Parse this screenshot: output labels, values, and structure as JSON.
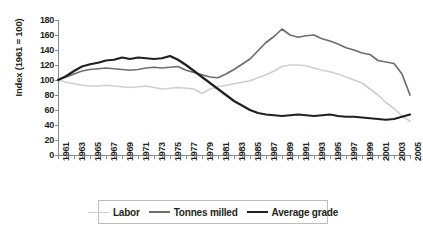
{
  "chart_data": {
    "type": "line",
    "title": "",
    "xlabel": "",
    "ylabel": "Index (1961 = 100)",
    "ylim": [
      0,
      180
    ],
    "yticks": [
      0,
      20,
      40,
      60,
      80,
      100,
      120,
      140,
      160,
      180
    ],
    "xlim": [
      1961,
      2005
    ],
    "grid": false,
    "legend_position": "bottom",
    "x": [
      1961,
      1962,
      1963,
      1964,
      1965,
      1966,
      1967,
      1968,
      1969,
      1970,
      1971,
      1972,
      1973,
      1974,
      1975,
      1976,
      1977,
      1978,
      1979,
      1980,
      1981,
      1982,
      1983,
      1984,
      1985,
      1986,
      1987,
      1988,
      1989,
      1990,
      1991,
      1992,
      1993,
      1994,
      1995,
      1996,
      1997,
      1998,
      1999,
      2000,
      2001,
      2002,
      2003,
      2004,
      2005
    ],
    "xtick_labels": [
      "1961",
      "1963",
      "1965",
      "1967",
      "1969",
      "1971",
      "1973",
      "1975",
      "1977",
      "1979",
      "1981",
      "1983",
      "1985",
      "1987",
      "1989",
      "1991",
      "1993",
      "1995",
      "1997",
      "1999",
      "2001",
      "2003",
      "2005"
    ],
    "series": [
      {
        "name": "Labor",
        "color": "#cfcfcf",
        "values": [
          100,
          97,
          95,
          93,
          92,
          92,
          93,
          92,
          91,
          90,
          91,
          92,
          90,
          88,
          89,
          90,
          89,
          88,
          82,
          88,
          91,
          93,
          95,
          97,
          99,
          103,
          107,
          112,
          118,
          120,
          120,
          119,
          116,
          113,
          111,
          108,
          104,
          100,
          96,
          88,
          80,
          70,
          62,
          52,
          45
        ]
      },
      {
        "name": "Tonnes milled",
        "color": "#6d6e70",
        "values": [
          100,
          104,
          108,
          112,
          114,
          115,
          116,
          115,
          114,
          113,
          114,
          116,
          117,
          116,
          117,
          118,
          113,
          110,
          107,
          104,
          103,
          108,
          114,
          121,
          128,
          139,
          150,
          158,
          168,
          160,
          157,
          159,
          160,
          155,
          152,
          148,
          143,
          140,
          136,
          134,
          126,
          124,
          122,
          108,
          80
        ]
      },
      {
        "name": "Average grade",
        "color": "#231f20",
        "values": [
          100,
          105,
          112,
          118,
          121,
          123,
          126,
          127,
          130,
          128,
          130,
          129,
          128,
          129,
          132,
          127,
          120,
          112,
          104,
          96,
          88,
          80,
          72,
          66,
          60,
          56,
          54,
          53,
          52,
          53,
          54,
          53,
          52,
          53,
          54,
          52,
          51,
          51,
          50,
          49,
          48,
          47,
          48,
          51,
          54
        ]
      }
    ]
  },
  "axis": {
    "ylabel": "Index (1961 = 100)"
  },
  "legend": {
    "items": [
      {
        "label": "Labor",
        "color": "#cfcfcf"
      },
      {
        "label": "Tonnes milled",
        "color": "#6d6e70"
      },
      {
        "label": "Average grade",
        "color": "#231f20"
      }
    ]
  }
}
